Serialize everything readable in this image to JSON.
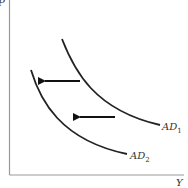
{
  "diagram": {
    "type": "aggregate-demand-shift",
    "axes": {
      "y_label": "P",
      "x_label": "Y"
    },
    "curves": [
      {
        "id": "AD1",
        "label_main": "AD",
        "label_sub": "1"
      },
      {
        "id": "AD2",
        "label_main": "AD",
        "label_sub": "2"
      }
    ],
    "arrows": [
      {
        "direction": "left",
        "meaning": "shift from AD1 to AD2"
      },
      {
        "direction": "left",
        "meaning": "shift from AD1 to AD2"
      }
    ],
    "colors": {
      "axis": "#888888",
      "curve": "#222222",
      "arrow": "#111111"
    }
  }
}
